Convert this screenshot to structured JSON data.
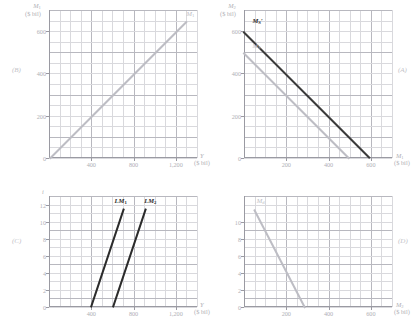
{
  "figure": {
    "panels": [
      {
        "id": "B",
        "letter": "(B)",
        "y_axis": {
          "title_var": "M",
          "title_sub": "1",
          "units": "($ bil)",
          "ticks": [
            "0",
            "200",
            "400",
            "600"
          ],
          "values": [
            0,
            200,
            400,
            600
          ],
          "max": 700
        },
        "x_axis": {
          "title_var": "Y",
          "units": "($ bil)",
          "ticks": [
            "400",
            "800",
            "1,200"
          ],
          "values": [
            400,
            800,
            1200
          ],
          "max": 1400
        },
        "curve_label": "M1",
        "curve_label_var": "M",
        "curve_label_sub": "1"
      },
      {
        "id": "A",
        "letter": "(A)",
        "y_axis": {
          "title_var": "M",
          "title_sub": "2",
          "units": "($ bil)",
          "ticks": [
            "0",
            "200",
            "400",
            "600"
          ],
          "values": [
            0,
            200,
            400,
            600
          ],
          "max": 700
        },
        "x_axis": {
          "title_var": "M",
          "title_sub": "1",
          "units": "($ bil)",
          "ticks": [
            "200",
            "400",
            "600"
          ],
          "values": [
            200,
            400,
            600
          ],
          "max": 700
        },
        "curves": [
          {
            "name": "M_S_prime",
            "label_var": "M",
            "label_sub": "S",
            "prime": true,
            "color": "black"
          },
          {
            "name": "M_S",
            "label_var": "M",
            "label_sub": "S",
            "prime": false,
            "color": "gray"
          }
        ]
      },
      {
        "id": "C",
        "letter": "(C)",
        "y_axis": {
          "title_var": "i",
          "units": "",
          "ticks": [
            "0",
            "2",
            "4",
            "6",
            "8",
            "10",
            "12"
          ],
          "values": [
            0,
            2,
            4,
            6,
            8,
            10,
            12
          ],
          "max": 13
        },
        "x_axis": {
          "title_var": "Y",
          "units": "($ bil)",
          "ticks": [
            "400",
            "800",
            "1,200"
          ],
          "values": [
            400,
            800,
            1200
          ],
          "max": 1400
        },
        "curves": [
          {
            "name": "LM1",
            "label_var": "LM",
            "label_sub": "1",
            "color": "black"
          },
          {
            "name": "LM2",
            "label_var": "LM",
            "label_sub": "2",
            "color": "black"
          }
        ]
      },
      {
        "id": "D",
        "letter": "(D)",
        "y_axis": {
          "title_var": "i",
          "units": "",
          "ticks": [
            "0",
            "2",
            "4",
            "6",
            "8",
            "10"
          ],
          "values": [
            0,
            2,
            4,
            6,
            8,
            10
          ],
          "max": 13
        },
        "x_axis": {
          "title_var": "M",
          "title_sub": "2",
          "units": "($ bil)",
          "ticks": [
            "200",
            "400",
            "600"
          ],
          "values": [
            200,
            400,
            600
          ],
          "max": 700
        },
        "curve_label_var": "M",
        "curve_label_sub": "d"
      }
    ]
  },
  "chart_data": [
    {
      "id": "B",
      "type": "line",
      "title": "",
      "xlabel": "Y ($ bil)",
      "ylabel": "M1 ($ bil)",
      "xlim": [
        0,
        1400
      ],
      "ylim": [
        0,
        700
      ],
      "grid": true,
      "series": [
        {
          "name": "M1",
          "color": "#bdbdc4",
          "points": [
            [
              0,
              0
            ],
            [
              1300,
              650
            ]
          ]
        }
      ],
      "xticks": [
        400,
        800,
        1200
      ],
      "xticklabels": [
        "400",
        "800",
        "1,200"
      ],
      "yticks": [
        0,
        200,
        400,
        600
      ],
      "yticklabels": [
        "0",
        "200",
        "400",
        "600"
      ],
      "annotations": [
        {
          "text": "M1",
          "x": 1300,
          "y": 680
        }
      ]
    },
    {
      "id": "A",
      "type": "line",
      "title": "",
      "xlabel": "M1 ($ bil)",
      "ylabel": "M2 ($ bil)",
      "xlim": [
        0,
        700
      ],
      "ylim": [
        0,
        700
      ],
      "grid": true,
      "series": [
        {
          "name": "M_S'",
          "color": "#3a3a3a",
          "points": [
            [
              0,
              600
            ],
            [
              600,
              0
            ]
          ]
        },
        {
          "name": "M_S",
          "color": "#bdbdc4",
          "points": [
            [
              0,
              500
            ],
            [
              500,
              0
            ]
          ]
        }
      ],
      "xticks": [
        200,
        400,
        600
      ],
      "xticklabels": [
        "200",
        "400",
        "600"
      ],
      "yticks": [
        0,
        200,
        400,
        600
      ],
      "yticklabels": [
        "0",
        "200",
        "400",
        "600"
      ],
      "annotations": [
        {
          "text": "M_S'",
          "x": 40,
          "y": 650
        },
        {
          "text": "M_S",
          "x": 40,
          "y": 530
        }
      ]
    },
    {
      "id": "C",
      "type": "line",
      "title": "",
      "xlabel": "Y ($ bil)",
      "ylabel": "i",
      "xlim": [
        0,
        1400
      ],
      "ylim": [
        0,
        13
      ],
      "grid": true,
      "series": [
        {
          "name": "LM1",
          "color": "#2b2b2b",
          "points": [
            [
              390,
              0
            ],
            [
              700,
              11.5
            ]
          ]
        },
        {
          "name": "LM2",
          "color": "#2b2b2b",
          "points": [
            [
              600,
              0
            ],
            [
              910,
              11.5
            ]
          ]
        }
      ],
      "xticks": [
        400,
        800,
        1200
      ],
      "xticklabels": [
        "400",
        "800",
        "1,200"
      ],
      "yticks": [
        0,
        2,
        4,
        6,
        8,
        10,
        12
      ],
      "yticklabels": [
        "0",
        "2",
        "4",
        "6",
        "8",
        "10",
        "12"
      ],
      "annotations": [
        {
          "text": "LM1",
          "x": 620,
          "y": 12.4
        },
        {
          "text": "LM2",
          "x": 900,
          "y": 12.4
        }
      ]
    },
    {
      "id": "D",
      "type": "line",
      "title": "",
      "xlabel": "M2 ($ bil)",
      "ylabel": "i",
      "xlim": [
        0,
        700
      ],
      "ylim": [
        0,
        13
      ],
      "grid": true,
      "series": [
        {
          "name": "Md",
          "color": "#bdbdc4",
          "points": [
            [
              50,
              11.5
            ],
            [
              290,
              0
            ]
          ]
        }
      ],
      "xticks": [
        200,
        400,
        600
      ],
      "xticklabels": [
        "200",
        "400",
        "600"
      ],
      "yticks": [
        0,
        2,
        4,
        6,
        8,
        10
      ],
      "yticklabels": [
        "0",
        "2",
        "4",
        "6",
        "8",
        "10"
      ],
      "annotations": [
        {
          "text": "M_d",
          "x": 60,
          "y": 12.4
        }
      ]
    }
  ]
}
